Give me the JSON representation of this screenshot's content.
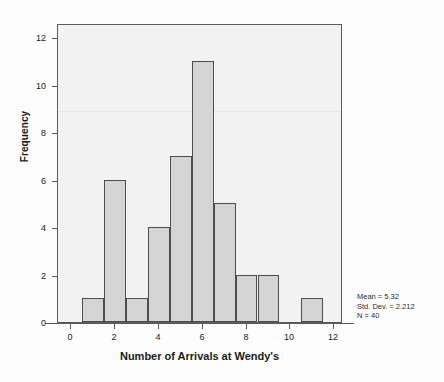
{
  "chart_data": {
    "type": "bar",
    "title": "",
    "xlabel": "Number of Arrivals at Wendy's",
    "ylabel": "Frequency",
    "categories": [
      0,
      1,
      2,
      3,
      4,
      5,
      6,
      7,
      8,
      9,
      10,
      11,
      12
    ],
    "values": [
      0,
      1,
      6,
      1,
      4,
      7,
      11,
      5,
      2,
      2,
      0,
      1,
      0
    ],
    "bars": [
      {
        "center": 1,
        "height": 1
      },
      {
        "center": 2,
        "height": 6
      },
      {
        "center": 3,
        "height": 1
      },
      {
        "center": 4,
        "height": 4
      },
      {
        "center": 5,
        "height": 7
      },
      {
        "center": 6,
        "height": 11
      },
      {
        "center": 7,
        "height": 5
      },
      {
        "center": 8,
        "height": 2
      },
      {
        "center": 9,
        "height": 2
      },
      {
        "center": 11,
        "height": 1
      }
    ],
    "bin_width": 1,
    "xlim": [
      -0.6,
      12.4
    ],
    "ylim": [
      0,
      12.6
    ],
    "xticks": [
      0,
      2,
      4,
      6,
      8,
      10,
      12
    ],
    "yticks": [
      0,
      2,
      4,
      6,
      8,
      10,
      12
    ],
    "xtick_labels": [
      "0",
      "2",
      "4",
      "6",
      "8",
      "10",
      "12"
    ],
    "ytick_labels": [
      "0",
      "2",
      "4",
      "6",
      "8",
      "10",
      "12"
    ],
    "grid": false,
    "legend": "none",
    "bar_fill_color": "#d4d4d4",
    "bar_edge_color": "#4d4d4d",
    "plot_background_color": "#f2f2f2"
  },
  "annotation": {
    "mean_line": "Mean = 5.32",
    "stddev_line": "Std. Dev. = 2.212",
    "n_line": "N = 40"
  }
}
